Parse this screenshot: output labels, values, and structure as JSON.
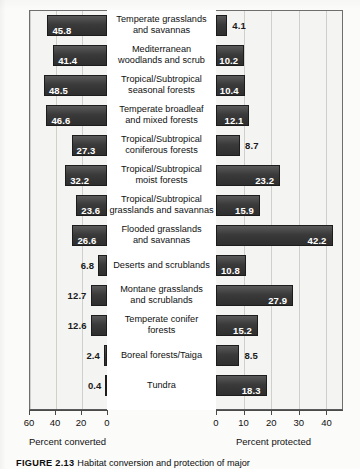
{
  "chart_data": {
    "type": "bar",
    "orientation": "horizontal",
    "layout": "bidirectional-pyramid",
    "title": "",
    "categories": [
      "Temperate grasslands and savannas",
      "Mediterranean woodlands and scrub",
      "Tropical/Subtropical seasonal forests",
      "Temperate broadleaf and mixed forests",
      "Tropical/Subtropical coniferous forests",
      "Tropical/Subtropical moist forests",
      "Tropical/Subtropical grasslands and savannas",
      "Flooded grasslands and savannas",
      "Deserts and scrublands",
      "Montane grasslands and scrublands",
      "Temperate conifer forests",
      "Boreal forests/Taiga",
      "Tundra"
    ],
    "category_lines": [
      [
        "Temperate grasslands",
        "and savannas"
      ],
      [
        "Mediterranean",
        "woodlands and scrub"
      ],
      [
        "Tropical/Subtropical",
        "seasonal forests"
      ],
      [
        "Temperate broadleaf",
        "and mixed forests"
      ],
      [
        "Tropical/Subtropical",
        "coniferous forests"
      ],
      [
        "Tropical/Subtropical",
        "moist forests"
      ],
      [
        "Tropical/Subtropical",
        "grasslands and savannas"
      ],
      [
        "Flooded grasslands",
        "and savannas"
      ],
      [
        "Deserts and scrublands"
      ],
      [
        "Montane grasslands",
        "and scrublands"
      ],
      [
        "Temperate conifer",
        "forests"
      ],
      [
        "Boreal forests/Taiga"
      ],
      [
        "Tundra"
      ]
    ],
    "series": [
      {
        "name": "Percent converted",
        "side": "left",
        "axis_label": "Percent converted",
        "axis_ticks": [
          60,
          40,
          20,
          0
        ],
        "axis_max": 60,
        "axis_reversed": true,
        "values": [
          45.8,
          41.4,
          48.5,
          46.6,
          27.3,
          32.2,
          23.6,
          26.6,
          6.8,
          12.7,
          12.6,
          2.4,
          0.4
        ]
      },
      {
        "name": "Percent protected",
        "side": "right",
        "axis_label": "Percent protected",
        "axis_ticks": [
          0,
          10,
          20,
          30,
          40
        ],
        "axis_max": 46,
        "axis_reversed": false,
        "values": [
          4.1,
          10.2,
          10.4,
          12.1,
          8.7,
          23.2,
          15.9,
          42.2,
          10.8,
          27.9,
          15.2,
          8.5,
          18.3
        ]
      }
    ],
    "grid": true,
    "legend": "none",
    "colors": {
      "bar_fill_dark": "#2e2e2e",
      "bar_fill_light": "#5a5a5a",
      "bar_border": "#1c1c1c",
      "plot_background": "#f4f4f2",
      "gridline": "#cfcfcb",
      "axis": "#4a4a4a",
      "value_inside": "#ffffff",
      "value_outside": "#1a1a1a"
    }
  },
  "caption": {
    "figure_number": "FIGURE 2.13",
    "text": "Habitat conversion and protection of major"
  }
}
